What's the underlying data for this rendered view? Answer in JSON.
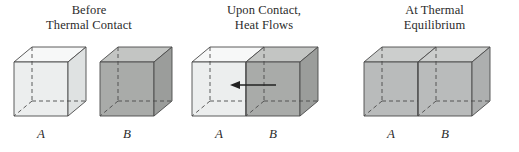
{
  "figure": {
    "background": "#ffffff",
    "panels": [
      {
        "id": "before-thermal-contact",
        "title_lines": [
          "Before",
          "Thermal Contact"
        ],
        "arrow": null,
        "blocks": [
          {
            "label": "A",
            "state": "cold",
            "front_color": "#eceeee",
            "top_color": "#f7f8f8",
            "side_color": "#dfe2e2"
          },
          {
            "label": "B",
            "state": "hot",
            "front_color": "#a9aba9",
            "top_color": "#c3c5c3",
            "side_color": "#9b9d9b"
          }
        ]
      },
      {
        "id": "upon-contact-heat-flows",
        "title_lines": [
          "Upon Contact,",
          "Heat Flows"
        ],
        "arrow": {
          "direction": "left",
          "meaning": "heat-flow-from-B-to-A"
        },
        "blocks": [
          {
            "label": "A",
            "state": "cold",
            "front_color": "#eceeee",
            "top_color": "#f7f8f8",
            "side_color": "#dfe2e2"
          },
          {
            "label": "B",
            "state": "hot",
            "front_color": "#a9aba9",
            "top_color": "#c3c5c3",
            "side_color": "#9b9d9b"
          }
        ]
      },
      {
        "id": "at-thermal-equilibrium",
        "title_lines": [
          "At Thermal",
          "Equilibrium"
        ],
        "arrow": null,
        "blocks": [
          {
            "label": "A",
            "state": "equilibrium",
            "front_color": "#b9bbbb",
            "top_color": "#cccecd",
            "side_color": "#adafaf"
          },
          {
            "label": "B",
            "state": "equilibrium",
            "front_color": "#b9bbbb",
            "top_color": "#cccecd",
            "side_color": "#adafaf"
          }
        ]
      }
    ],
    "colors": {
      "edge_stroke": "#4a4a4a",
      "hidden_edge_stroke": "#4a4a4a",
      "arrow_stroke": "#222222",
      "text": "#2b2b2b"
    }
  }
}
